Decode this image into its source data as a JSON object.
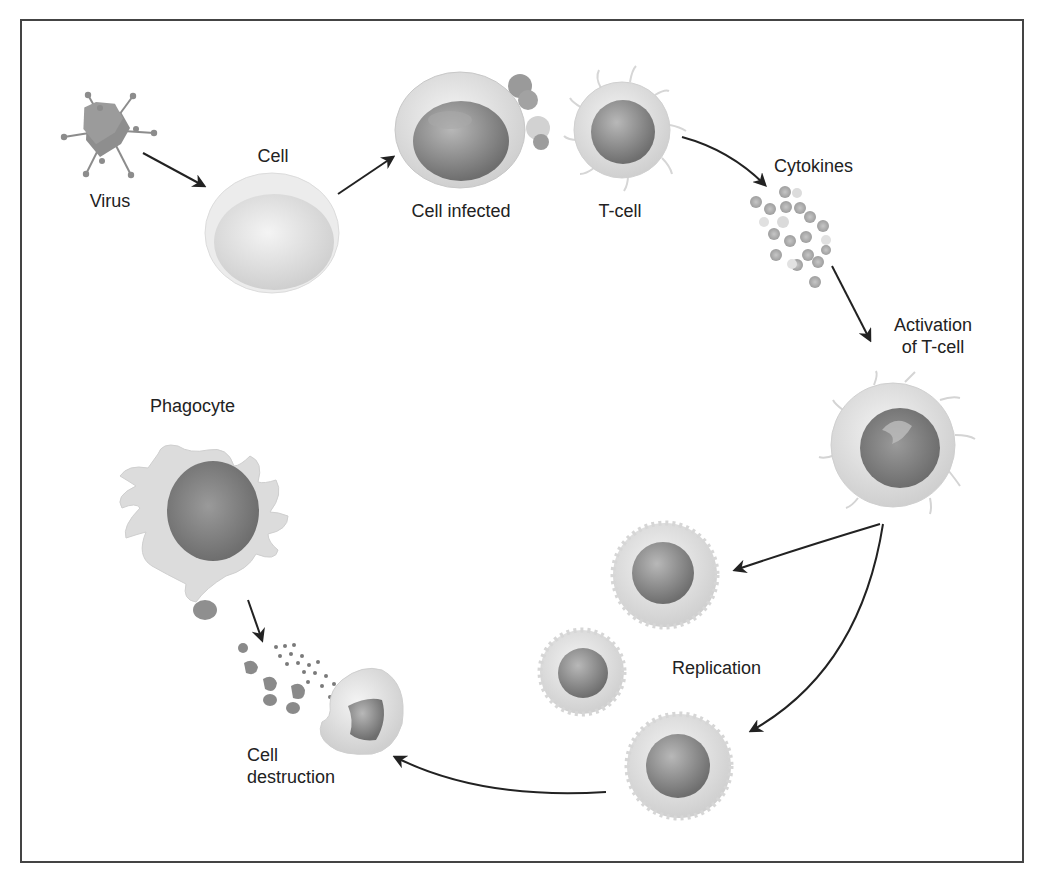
{
  "diagram": {
    "title": "",
    "type": "immune-response-cycle",
    "colors": {
      "border": "#444444",
      "arrow": "#222222",
      "cell_light": "#e4e4e4",
      "nucleus": "#8a8a8a",
      "text": "#222222"
    },
    "labels": {
      "virus": "Virus",
      "cell": "Cell",
      "cell_infected": "Cell infected",
      "t_cell": "T-cell",
      "cytokines": "Cytokines",
      "activation_line1": "Activation",
      "activation_line2": "of T-cell",
      "replication": "Replication",
      "phagocyte": "Phagocyte",
      "destruction_line1": "Cell",
      "destruction_line2": "destruction"
    },
    "nodes": [
      {
        "id": "virus",
        "label": "Virus"
      },
      {
        "id": "cell",
        "label": "Cell"
      },
      {
        "id": "cell_infected",
        "label": "Cell infected"
      },
      {
        "id": "t_cell",
        "label": "T-cell"
      },
      {
        "id": "cytokines",
        "label": "Cytokines"
      },
      {
        "id": "activated_t_cell",
        "label": "Activation of T-cell"
      },
      {
        "id": "replication",
        "label": "Replication"
      },
      {
        "id": "cell_destruction",
        "label": "Cell destruction"
      },
      {
        "id": "phagocyte",
        "label": "Phagocyte"
      }
    ],
    "edges": [
      {
        "from": "virus",
        "to": "cell"
      },
      {
        "from": "cell",
        "to": "cell_infected"
      },
      {
        "from": "t_cell",
        "to": "cytokines"
      },
      {
        "from": "cytokines",
        "to": "activated_t_cell"
      },
      {
        "from": "activated_t_cell",
        "to": "replication"
      },
      {
        "from": "replication",
        "to": "cell_destruction"
      },
      {
        "from": "phagocyte",
        "to": "cell_destruction"
      }
    ]
  }
}
